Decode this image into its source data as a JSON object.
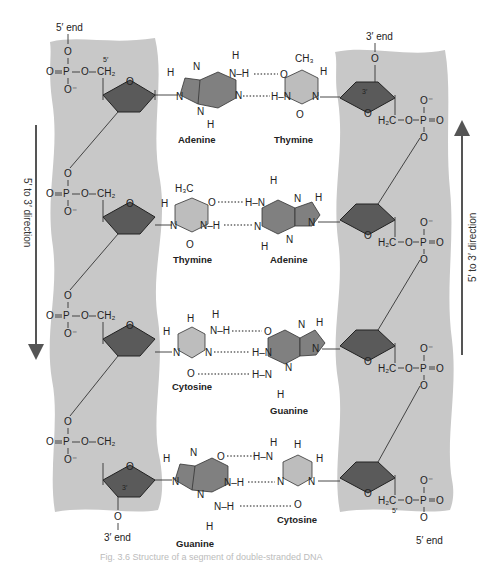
{
  "colors": {
    "backbone": "#c8c8c8",
    "sugar": "#5a5a5a",
    "purine": "#808080",
    "pyrimidine": "#bdbdbd",
    "arrow": "#555555",
    "text": "#222222"
  },
  "left_strand": {
    "top_label": "5′ end",
    "bottom_label": "3′ end",
    "carbon_5_label": "5′",
    "carbon_3_label": "3′",
    "direction_label": "5′ to 3′ direction",
    "phosphate": {
      "o_top": "O",
      "p": "P",
      "o_double": "O",
      "o_minus": "O⁻",
      "linker": "O",
      "ch2": "CH₂"
    }
  },
  "right_strand": {
    "top_label": "3′ end",
    "bottom_label": "5′ end",
    "carbon_5_label": "5′",
    "carbon_3_label": "3′",
    "direction_label": "5′ to 3′ direction",
    "phosphate": {
      "o_minus": "O⁻",
      "p": "P",
      "o_double": "O",
      "o_bottom": "O",
      "linker": "O",
      "h2c": "H₂C"
    }
  },
  "sugar_ring_oxygen": "O",
  "base_pairs": [
    {
      "left": "Adenine",
      "right": "Thymine"
    },
    {
      "left": "Thymine",
      "right": "Adenine"
    },
    {
      "left": "Cytosine",
      "right": "Guanine"
    },
    {
      "left": "Guanine",
      "right": "Cytosine"
    }
  ],
  "atoms": {
    "H": "H",
    "N": "N",
    "O": "O",
    "CH3": "CH₃",
    "H3C": "H₃C"
  },
  "caption": "Fig. 3.6  Structure of a segment of double-stranded DNA"
}
